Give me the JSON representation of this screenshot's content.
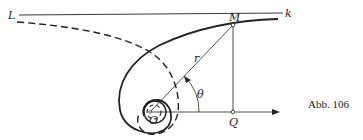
{
  "figure": {
    "caption": "Abb. 106",
    "labels": {
      "asymptote_left": "L",
      "asymptote_right": "k",
      "point_m": "M",
      "radius": "r",
      "angle": "θ",
      "origin": "O",
      "point_q": "Q"
    },
    "colors": {
      "ink": "#222222",
      "background": "#ffffff"
    }
  }
}
